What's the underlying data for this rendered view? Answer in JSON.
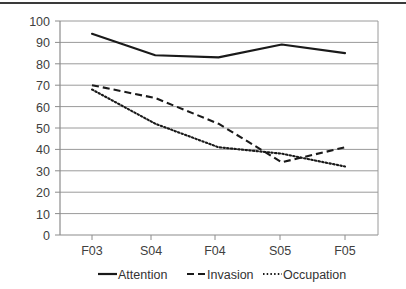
{
  "chart_data": {
    "type": "line",
    "title": "",
    "subtitle": "",
    "xlabel": "",
    "ylabel": "",
    "categories": [
      "F03",
      "S04",
      "F04",
      "S05",
      "F05"
    ],
    "ylim": [
      0,
      100
    ],
    "ytick_step": 10,
    "yticks": [
      0,
      10,
      20,
      30,
      40,
      50,
      60,
      70,
      80,
      90,
      100
    ],
    "grid": true,
    "legend_position": "bottom",
    "series": [
      {
        "name": "Attention",
        "style": "solid",
        "color": "#1a1a1a",
        "values": [
          94,
          84,
          83,
          89,
          85
        ]
      },
      {
        "name": "Invasion",
        "style": "dashed",
        "color": "#1a1a1a",
        "values": [
          70,
          64,
          52,
          34,
          41
        ]
      },
      {
        "name": "Occupation",
        "style": "dotted",
        "color": "#1a1a1a",
        "values": [
          68,
          52,
          41,
          38,
          32
        ]
      }
    ]
  },
  "axes": {
    "y_tick_labels": [
      "100",
      "90",
      "80",
      "70",
      "60",
      "50",
      "40",
      "30",
      "20",
      "10",
      "0"
    ],
    "x_tick_labels": [
      "F03",
      "S04",
      "F04",
      "S05",
      "F05"
    ]
  },
  "legend": {
    "entries": [
      {
        "label": "Attention",
        "style": "solid"
      },
      {
        "label": "Invasion",
        "style": "dashed"
      },
      {
        "label": "Occupation",
        "style": "dotted"
      }
    ]
  }
}
